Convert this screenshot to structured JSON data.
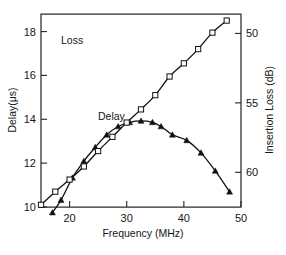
{
  "chart_data": {
    "type": "line",
    "title": "",
    "xlabel": "Frequency (MHz)",
    "ylabel": "Delay(μs)",
    "y2label": "Insertion Loss (dB)",
    "xlim": [
      15,
      50
    ],
    "ylim": [
      10,
      18.8
    ],
    "y2lim": [
      48.6,
      62.5
    ],
    "y2_inverted": true,
    "grid": false,
    "xticks": [
      20,
      30,
      40,
      50
    ],
    "xtick_labels": [
      "20",
      "30",
      "40",
      "50"
    ],
    "yticks": [
      10,
      12,
      14,
      16,
      18
    ],
    "ytick_labels": [
      "10",
      "12",
      "14",
      "16",
      "18"
    ],
    "y2ticks": [
      50,
      55,
      60
    ],
    "y2tick_labels": [
      "50",
      "55",
      "60"
    ],
    "legend_position": "inline-annotations",
    "series": [
      {
        "name": "Loss",
        "label": "Loss",
        "axis": "right",
        "marker": "filled-triangle",
        "unit": "dB",
        "x": [
          17.0,
          18.5,
          20.5,
          22.5,
          24.5,
          26.5,
          28.5,
          30.5,
          32.5,
          34.5,
          36.0,
          38.0,
          40.5,
          43.0,
          45.5,
          48.0
        ],
        "values": [
          62.9,
          62.0,
          60.4,
          59.2,
          58.2,
          57.3,
          56.7,
          56.4,
          56.3,
          56.4,
          56.7,
          57.3,
          57.7,
          58.6,
          59.9,
          61.4
        ]
      },
      {
        "name": "Delay",
        "label": "Delay",
        "axis": "left",
        "marker": "open-square",
        "unit": "μs",
        "x": [
          15.0,
          17.5,
          20.0,
          22.5,
          25.0,
          27.5,
          30.0,
          32.5,
          35.0,
          37.5,
          40.0,
          42.5,
          45.0,
          47.5
        ],
        "values": [
          10.1,
          10.7,
          11.25,
          11.85,
          12.55,
          13.2,
          13.85,
          14.45,
          15.1,
          15.95,
          16.55,
          17.2,
          17.95,
          18.5
        ]
      }
    ],
    "annotations": [
      {
        "text": "Loss",
        "x_px": 61,
        "y_px": 44
      },
      {
        "text": "Delay",
        "x_px": 98,
        "y_px": 120
      }
    ]
  }
}
